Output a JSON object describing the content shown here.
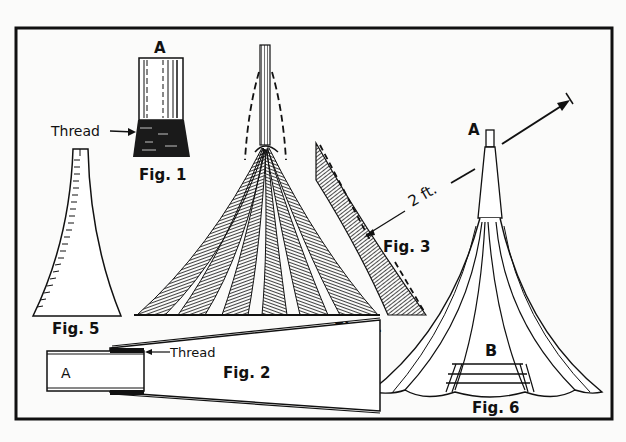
{
  "figure": {
    "style": "black-and-white line illustration",
    "colors": {
      "ink": "#111111",
      "paper": "#fbfbfa"
    },
    "labels": {
      "fig1": "Fig. 1",
      "fig1_top": "A",
      "fig1_thread": "Thread",
      "fig2": "Fig. 2",
      "fig2_box": "A",
      "fig2_thread": "Thread",
      "fig3": "Fig. 3",
      "fig3_dimension": "2 ft.",
      "fig4": "Fig. 4",
      "fig5": "Fig. 5",
      "fig6": "Fig. 6",
      "fig6_top": "A",
      "fig6_base": "B"
    }
  }
}
